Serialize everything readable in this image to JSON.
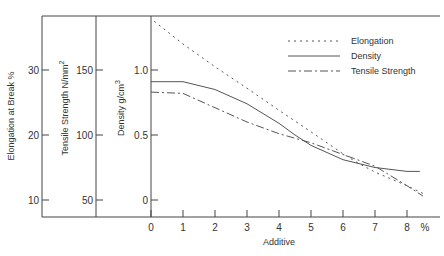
{
  "chart_data": {
    "type": "line",
    "title": "",
    "xlabel": "Additive",
    "x_unit": "%",
    "xlim": [
      0,
      8.7
    ],
    "x_ticks": [
      0,
      1,
      2,
      3,
      4,
      5,
      6,
      7,
      8
    ],
    "y_axes": [
      {
        "label": "Elongation at Break %",
        "ticks": [
          10,
          20,
          30
        ],
        "range": [
          7.5,
          38.5
        ]
      },
      {
        "label": "Tensile Strength N/mm²",
        "ticks": [
          50,
          100,
          150
        ],
        "range": [
          37.5,
          192
        ]
      },
      {
        "label": "Density g/cm³",
        "ticks": [
          0,
          0.5,
          1.0
        ],
        "tick_labels": [
          "0",
          "0.5",
          "1.0"
        ],
        "range": [
          -0.13,
          1.42
        ]
      }
    ],
    "grid": false,
    "legend_position": "upper right",
    "series": [
      {
        "name": "Elongation",
        "axis": 0,
        "style": "dotted",
        "x": [
          0.1,
          1,
          2,
          3,
          4,
          5,
          6,
          6.5,
          7,
          8,
          8.5
        ],
        "values": [
          37.5,
          34.0,
          30.5,
          27.2,
          23.8,
          20.5,
          17.1,
          15.6,
          14.3,
          12.2,
          11.0
        ]
      },
      {
        "name": "Density",
        "axis": 2,
        "style": "solid",
        "x": [
          0,
          1,
          2,
          3,
          4,
          4.5,
          5,
          6,
          7,
          8,
          8.4
        ],
        "values": [
          0.91,
          0.91,
          0.85,
          0.74,
          0.59,
          0.5,
          0.42,
          0.31,
          0.25,
          0.22,
          0.22
        ]
      },
      {
        "name": "Tensile Strength",
        "axis": 1,
        "style": "dash-dot",
        "x": [
          0,
          1,
          2,
          3,
          4,
          5,
          6,
          7,
          8,
          8.5
        ],
        "values": [
          133,
          132,
          121,
          110,
          101,
          94,
          85,
          76,
          61,
          53
        ]
      }
    ]
  },
  "legend": {
    "items": [
      {
        "label": "Elongation"
      },
      {
        "label": "Density"
      },
      {
        "label": "Tensile Strength"
      }
    ]
  },
  "axes": {
    "x_title": "Additive",
    "x_unit": "%",
    "elongation_title": "Elongation at Break %",
    "tensile_title": "Tensile Strength  N/mm",
    "tensile_sup": "2",
    "density_title": "Density  g/cm",
    "density_sup": "3"
  }
}
